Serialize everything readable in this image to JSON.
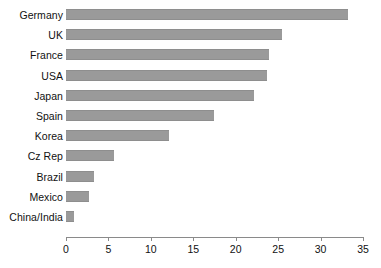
{
  "chart_data": {
    "type": "bar",
    "orientation": "horizontal",
    "title": "",
    "xlabel": "",
    "ylabel": "",
    "categories": [
      "Germany",
      "UK",
      "France",
      "USA",
      "Japan",
      "Spain",
      "Korea",
      "Cz Rep",
      "Brazil",
      "Mexico",
      "China/India"
    ],
    "values": [
      33.2,
      25.4,
      23.9,
      23.7,
      22.2,
      17.4,
      12.1,
      5.7,
      3.3,
      2.7,
      1.0
    ],
    "xlim": [
      0,
      35
    ],
    "xticks": [
      0,
      5,
      10,
      15,
      20,
      25,
      30,
      35
    ],
    "xtick_labels": [
      "0",
      "5",
      "10",
      "15",
      "20",
      "25",
      "30",
      "35"
    ],
    "grid": false,
    "legend": false,
    "bar_color": "#9a9a9a",
    "axis_color": "#8a8a8a",
    "background": "#ffffff"
  }
}
